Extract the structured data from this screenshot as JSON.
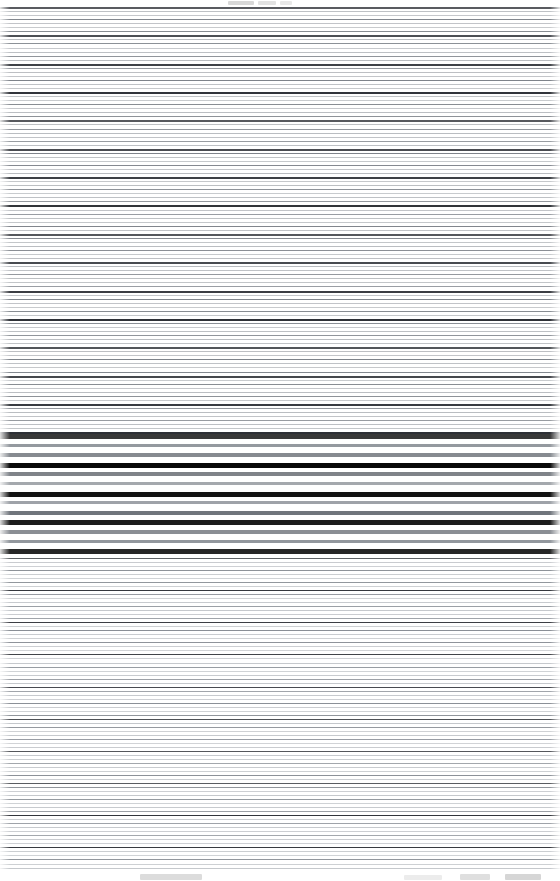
{
  "canvas": {
    "width": 560,
    "height": 881,
    "background": "#ffffff",
    "description": "Corrupted screenshot collapsed into full-width horizontal scanlines"
  },
  "header_band": {
    "y": 0,
    "height": 7,
    "smudges": [
      {
        "x": 228,
        "y": 1,
        "width": 26,
        "height": 4,
        "color": "#d8d8d8"
      },
      {
        "x": 258,
        "y": 1,
        "width": 18,
        "height": 4,
        "color": "#e2e2e2"
      },
      {
        "x": 280,
        "y": 1,
        "width": 12,
        "height": 4,
        "color": "#e8e8e8"
      }
    ]
  },
  "footer_band": {
    "y": 871,
    "height": 10,
    "smudges": [
      {
        "x": 140,
        "y": 3,
        "width": 62,
        "height": 6,
        "color": "#dcdcdc"
      },
      {
        "x": 404,
        "y": 4,
        "width": 38,
        "height": 5,
        "color": "#ececec"
      },
      {
        "x": 460,
        "y": 3,
        "width": 30,
        "height": 6,
        "color": "#dfdfdf"
      },
      {
        "x": 505,
        "y": 3,
        "width": 36,
        "height": 6,
        "color": "#d6d6d6"
      }
    ]
  },
  "zones": [
    {
      "name": "upper-dense-zone",
      "top": 7,
      "height": 427,
      "pitch": 4.05,
      "line_height": 1,
      "base_color": "#b9bcc0",
      "accent_color": "#2a2d33",
      "mid_color": "#7e838a",
      "accent_every": 7,
      "mid_every": 3,
      "accent_height": 2,
      "mid_height": 1
    },
    {
      "name": "emphasis-zone",
      "top": 434,
      "height": 124,
      "pitch": 9.6,
      "line_height": 3,
      "base_color": "#8b9097",
      "accent_color": "#000000",
      "mid_color": "#6d7279",
      "accent_every": 3,
      "mid_every": 2,
      "accent_height": 5,
      "mid_height": 4
    },
    {
      "name": "lower-dense-zone",
      "top": 558,
      "height": 313,
      "pitch": 4.02,
      "line_height": 1,
      "base_color": "#c4c7cb",
      "accent_color": "#31343a",
      "mid_color": "#8a8f96",
      "accent_every": 8,
      "mid_every": 3,
      "accent_height": 1,
      "mid_height": 1
    }
  ],
  "palette": {
    "page_background": "#ffffff",
    "line_light": "#c4c7cb",
    "line_mid": "#7e838a",
    "line_dark": "#2a2d33",
    "line_black": "#000000",
    "smudge_grey": "#dcdcdc"
  }
}
